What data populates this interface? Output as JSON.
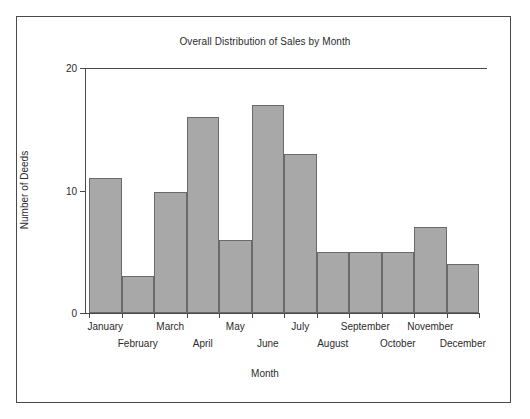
{
  "chart_data": {
    "type": "bar",
    "title": "Overall Distribution of Sales by Month",
    "xlabel": "Month",
    "ylabel": "Number of Deeds",
    "categories": [
      "January",
      "February",
      "March",
      "April",
      "May",
      "June",
      "July",
      "August",
      "September",
      "October",
      "November",
      "December"
    ],
    "values": [
      11,
      3,
      9.9,
      16,
      6,
      17,
      13,
      5,
      5,
      5,
      7,
      4
    ],
    "ylim": [
      0,
      20
    ],
    "yticks": [
      0,
      10,
      20
    ],
    "ytick_labels": [
      "0",
      "10",
      "20"
    ],
    "grid": false,
    "legend": null,
    "bar_fill_color": "#a8a8a8",
    "bar_edge_color": "#6a6a6a",
    "axis_color": "#4a4a4a",
    "text_color": "#2b2b2b",
    "frame_color": "#4a4a4a",
    "background_color": "#ffffff"
  }
}
